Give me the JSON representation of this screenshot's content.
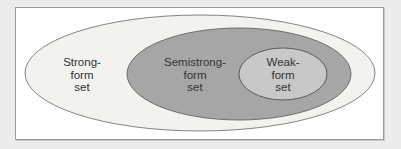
{
  "diagram": {
    "type": "nested-sets",
    "colors": {
      "background": "#ececec",
      "frame": "#ffffff",
      "frame_border": "#9a9a9a",
      "outer_fill": "#f2f2ee",
      "middle_fill": "#a6a6a6",
      "inner_fill": "#c8c8c8",
      "stroke": "#555555",
      "text": "#333333"
    },
    "sets": [
      {
        "id": "strong",
        "lines": [
          "Strong-",
          "form",
          "set"
        ]
      },
      {
        "id": "semistrong",
        "lines": [
          "Semistrong-",
          "form",
          "set"
        ]
      },
      {
        "id": "weak",
        "lines": [
          "Weak-",
          "form",
          "set"
        ]
      }
    ]
  }
}
